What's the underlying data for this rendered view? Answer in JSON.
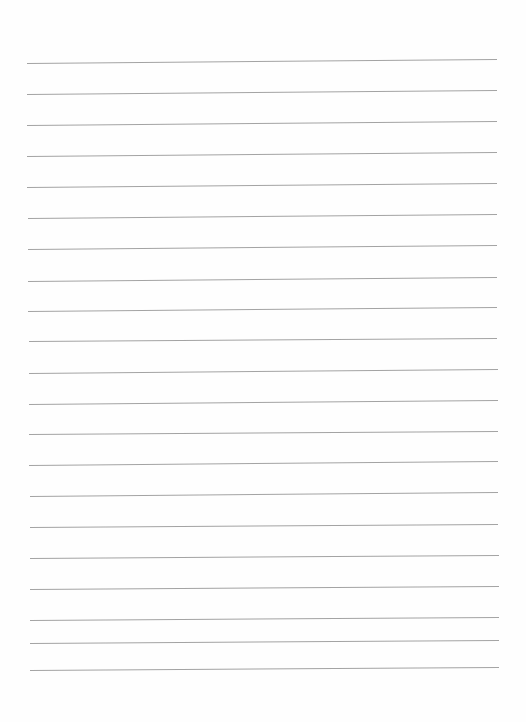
{
  "page": {
    "type": "blank lined paper",
    "background_color": "#fefefe",
    "line_color": "#a3a3a3",
    "text_content": ""
  },
  "rules": [
    {
      "x1": 27,
      "y1": 63,
      "x2": 497,
      "y2": 59
    },
    {
      "x1": 27,
      "y1": 94,
      "x2": 497,
      "y2": 90
    },
    {
      "x1": 27,
      "y1": 125,
      "x2": 497,
      "y2": 121
    },
    {
      "x1": 27,
      "y1": 156,
      "x2": 497,
      "y2": 152
    },
    {
      "x1": 27,
      "y1": 187,
      "x2": 497,
      "y2": 183
    },
    {
      "x1": 28,
      "y1": 218,
      "x2": 497,
      "y2": 214
    },
    {
      "x1": 28,
      "y1": 249,
      "x2": 497,
      "y2": 245
    },
    {
      "x1": 28,
      "y1": 281,
      "x2": 497,
      "y2": 277
    },
    {
      "x1": 28,
      "y1": 311,
      "x2": 497,
      "y2": 307
    },
    {
      "x1": 29,
      "y1": 341,
      "x2": 497,
      "y2": 338
    },
    {
      "x1": 29,
      "y1": 373,
      "x2": 498,
      "y2": 369
    },
    {
      "x1": 29,
      "y1": 404,
      "x2": 498,
      "y2": 400
    },
    {
      "x1": 29,
      "y1": 434,
      "x2": 498,
      "y2": 431
    },
    {
      "x1": 29,
      "y1": 465,
      "x2": 498,
      "y2": 461
    },
    {
      "x1": 30,
      "y1": 496,
      "x2": 498,
      "y2": 492
    },
    {
      "x1": 30,
      "y1": 527,
      "x2": 498,
      "y2": 524
    },
    {
      "x1": 30,
      "y1": 558,
      "x2": 499,
      "y2": 555
    },
    {
      "x1": 30,
      "y1": 589,
      "x2": 499,
      "y2": 586
    },
    {
      "x1": 30,
      "y1": 620,
      "x2": 499,
      "y2": 617
    },
    {
      "x1": 30,
      "y1": 643,
      "x2": 499,
      "y2": 640
    },
    {
      "x1": 30,
      "y1": 670,
      "x2": 499,
      "y2": 667
    }
  ]
}
